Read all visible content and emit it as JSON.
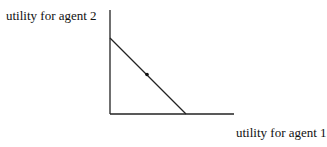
{
  "labels": {
    "y_axis": "utility for agent 2",
    "x_axis": "utility for agent 1"
  },
  "diagram": {
    "type": "utility-possibility-frontier",
    "frontier": "straight line from y-axis intercept to x-axis intercept",
    "marked_point": "midpoint on frontier"
  }
}
